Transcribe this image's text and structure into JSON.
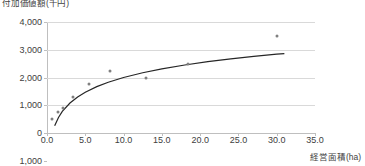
{
  "chart_data": {
    "type": "scatter",
    "title": "付加価値額(千円)",
    "ylabel": "付加価値額(千円)",
    "xlabel": "経営面積(ha)",
    "xlim": [
      0.0,
      35.0
    ],
    "ylim": [
      -1000,
      4000
    ],
    "grid": true,
    "legend": "none",
    "xticks": [
      "0.0",
      "5.0",
      "10.0",
      "15.0",
      "20.0",
      "25.0",
      "30.0",
      "35.0"
    ],
    "xtick_values": [
      0.0,
      5.0,
      10.0,
      15.0,
      20.0,
      25.0,
      30.0,
      35.0
    ],
    "yticks": [
      "4,000",
      "3,000",
      "2,000",
      "1,000",
      "0",
      "1,000"
    ],
    "ytick_values": [
      4000,
      3000,
      2000,
      1000,
      0,
      -1000
    ],
    "series": [
      {
        "name": "観測値",
        "marker": "dot",
        "color": "#808080",
        "x": [
          0.7,
          1.4,
          2.1,
          3.4,
          5.5,
          8.2,
          12.9,
          18.4,
          30.0
        ],
        "y": [
          500,
          750,
          900,
          1300,
          1760,
          2230,
          1980,
          2480,
          3490
        ]
      },
      {
        "name": "近似曲線",
        "type": "line",
        "color": "#262626",
        "curve": "logarithmic",
        "x": [
          1.0,
          1.5,
          2.0,
          3.0,
          4.0,
          5.0,
          6.5,
          8.0,
          10.0,
          12.5,
          15.0,
          18.0,
          21.0,
          24.0,
          27.0,
          30.0,
          31.0
        ],
        "y": [
          260,
          560,
          780,
          1080,
          1300,
          1470,
          1670,
          1830,
          2000,
          2170,
          2310,
          2450,
          2570,
          2670,
          2760,
          2840,
          2860
        ]
      }
    ]
  }
}
